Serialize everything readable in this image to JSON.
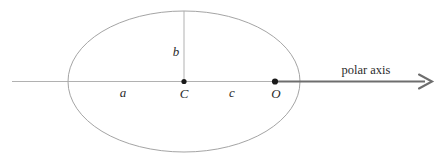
{
  "figure": {
    "kind": "geometry-diagram",
    "background_color": "#ffffff"
  },
  "colors": {
    "ellipse_stroke": "#9a9a9a",
    "thin_axis_stroke": "#a8a8a8",
    "polar_axis_stroke": "#6e6e6e",
    "vertical_segment_stroke": "#a8a8a8",
    "point_fill": "#1a1a1a",
    "label_color": "#2b2b2b"
  },
  "geometry": {
    "ellipse": {
      "center_x": 184,
      "center_y": 81.5,
      "semi_major_a": 116,
      "semi_minor_b": 70.5,
      "stroke_width": 0.9
    },
    "horizontal_axis": {
      "thin_x1": 12,
      "thin_x2": 275,
      "y": 81.5,
      "thin_stroke_width": 0.9
    },
    "polar_ray": {
      "x1": 275,
      "x2": 425,
      "y": 81.5,
      "stroke_width": 2.1,
      "arrow_tip_x": 432,
      "arrow_half_height": 7
    },
    "vertical_segment": {
      "x": 184,
      "y_top": 11,
      "y_bottom": 81.5,
      "stroke_width": 0.9
    },
    "points": [
      {
        "id": "C",
        "x": 184,
        "y": 81.5,
        "radius": 2.6
      },
      {
        "id": "O",
        "x": 275,
        "y": 81.5,
        "radius": 3.1
      }
    ]
  },
  "labels": {
    "a": {
      "text": "a",
      "x": 123,
      "y": 97,
      "style": "math"
    },
    "b": {
      "text": "b",
      "x": 176,
      "y": 56,
      "style": "math"
    },
    "c": {
      "text": "c",
      "x": 232,
      "y": 97,
      "style": "math"
    },
    "center_point": {
      "text": "C",
      "x": 184,
      "y": 98,
      "style": "math"
    },
    "origin_point": {
      "text": "O",
      "x": 276,
      "y": 98,
      "style": "math"
    },
    "polar_axis": {
      "text": "polar axis",
      "x": 366,
      "y": 74,
      "style": "plain"
    }
  }
}
